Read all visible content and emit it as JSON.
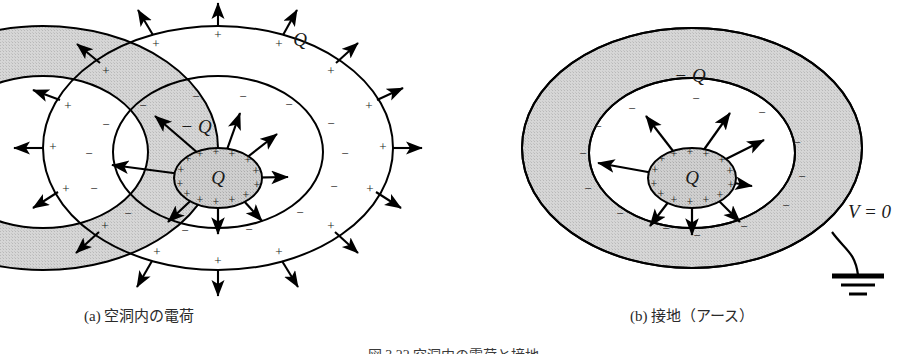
{
  "figure": {
    "kind": "physics-diagram",
    "topic": "electrostatic-induction",
    "caption": "図 3.22  空洞内の電荷と接地",
    "colors": {
      "conductor_fill": "#d2d2d2",
      "inner_charge_fill": "#c9c9c9",
      "outline": "#000000",
      "text": "#2a2a2a"
    },
    "panels": [
      {
        "id": "a",
        "caption": "(a) 空洞内の電荷",
        "grounded": false,
        "labels": {
          "outer_charge": "Q",
          "cavity_wall_charge": "− Q",
          "inner_charge": "Q"
        },
        "outer_surface_sign": "+",
        "cavity_wall_sign": "−",
        "inner_body_sign": "+",
        "outer_field_lines": 14,
        "cavity_field_lines": 8,
        "outer_surface_sign_count": 12,
        "cavity_wall_sign_count": 12,
        "inner_body_sign_count": 14
      },
      {
        "id": "b",
        "caption": "(b) 接地（アース）",
        "grounded": true,
        "labels": {
          "shell_charge": "− Q",
          "inner_charge": "Q",
          "potential": "V = 0"
        },
        "outer_surface_sign": "",
        "cavity_wall_sign": "−",
        "inner_body_sign": "+",
        "outer_field_lines": 0,
        "cavity_field_lines": 8,
        "cavity_wall_sign_count": 12,
        "inner_body_sign_count": 14,
        "ground_symbol": {
          "name": "earth-ground",
          "bars": 3
        }
      }
    ]
  }
}
